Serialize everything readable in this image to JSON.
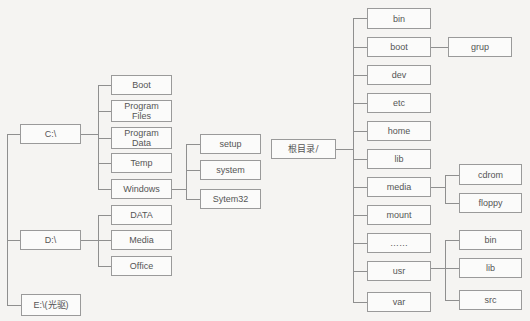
{
  "windows_tree": {
    "drives": [
      {
        "label": "C:\\"
      },
      {
        "label": "D:\\"
      },
      {
        "label": "E:\\(光驱)"
      }
    ],
    "c_children": [
      "Boot",
      "Program Files",
      "Program Data",
      "Temp",
      "Windows"
    ],
    "d_children": [
      "DATA",
      "Media",
      "Office"
    ],
    "windows_children": [
      "setup",
      "system",
      "Sytem32"
    ]
  },
  "linux_tree": {
    "root": "根目录/",
    "root_children": [
      "bin",
      "boot",
      "dev",
      "etc",
      "home",
      "lib",
      "media",
      "mount",
      "……",
      "usr",
      "var"
    ],
    "boot_children": [
      "grup"
    ],
    "media_children": [
      "cdrom",
      "floppy"
    ],
    "usr_children": [
      "bin",
      "lib",
      "src"
    ]
  }
}
